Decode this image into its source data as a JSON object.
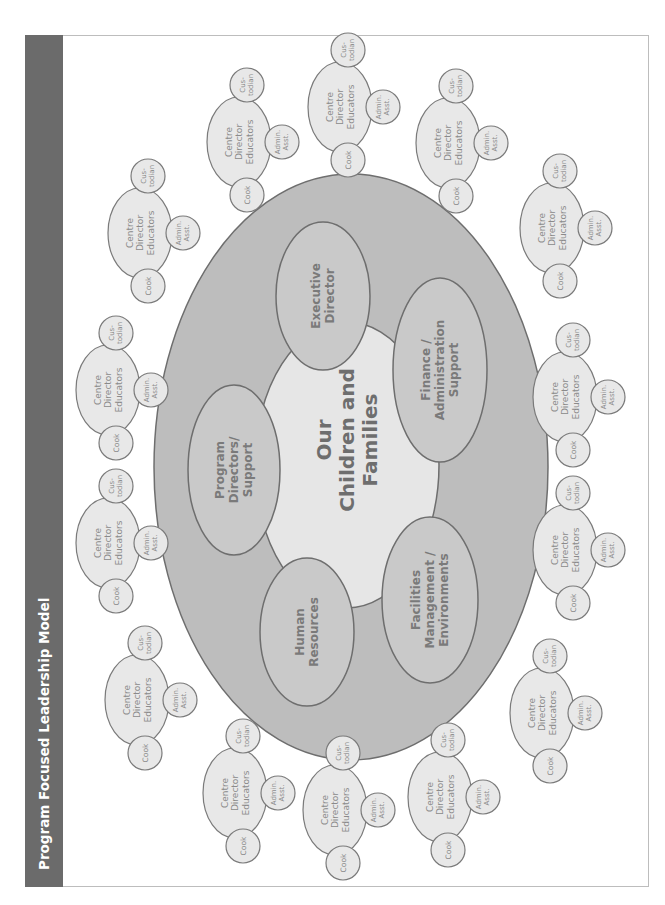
{
  "title": "Program Focused Leadership Model",
  "colors": {
    "title_strip": "#6b6b6b",
    "outer_ring": "#bdbdbd",
    "inner_core": "#e6e6e6",
    "department_fill": "#c9c9c9",
    "satellite_fill": "#e8e8e8",
    "stroke": "#7a7a7a"
  },
  "center": {
    "lines": [
      "Our",
      "Children and",
      "Families"
    ]
  },
  "departments": [
    {
      "id": "executive-director",
      "lines": [
        "Executive",
        "Director"
      ],
      "cx": 323,
      "cy": 296,
      "rx": 47,
      "ry": 74
    },
    {
      "id": "finance-administration-support",
      "lines": [
        "Finance /",
        "Administration",
        "Support"
      ],
      "cx": 440,
      "cy": 370,
      "rx": 47,
      "ry": 92
    },
    {
      "id": "facilities-management-environments",
      "lines": [
        "Facilities",
        "Management /",
        "Environments"
      ],
      "cx": 430,
      "cy": 600,
      "rx": 48,
      "ry": 83
    },
    {
      "id": "human-resources",
      "lines": [
        "Human",
        "Resources"
      ],
      "cx": 307,
      "cy": 632,
      "rx": 47,
      "ry": 74
    },
    {
      "id": "program-directors-support",
      "lines": [
        "Program",
        "Directors/",
        "Support"
      ],
      "cx": 234,
      "cy": 470,
      "rx": 46,
      "ry": 85
    }
  ],
  "satellite_labels": {
    "main": [
      "Centre",
      "Director",
      "Educators"
    ],
    "cook": "Cook",
    "custodian": [
      "Cus-",
      "todian"
    ],
    "admin": [
      "Admin.",
      "Asst."
    ]
  },
  "satellites": [
    {
      "cx": 140,
      "cy": 233
    },
    {
      "cx": 239,
      "cy": 142
    },
    {
      "cx": 340,
      "cy": 107
    },
    {
      "cx": 448,
      "cy": 143
    },
    {
      "cx": 552,
      "cy": 228
    },
    {
      "cx": 565,
      "cy": 397
    },
    {
      "cx": 565,
      "cy": 550
    },
    {
      "cx": 542,
      "cy": 713
    },
    {
      "cx": 440,
      "cy": 797
    },
    {
      "cx": 335,
      "cy": 810
    },
    {
      "cx": 235,
      "cy": 793
    },
    {
      "cx": 137,
      "cy": 700
    },
    {
      "cx": 108,
      "cy": 543
    },
    {
      "cx": 108,
      "cy": 390
    }
  ]
}
